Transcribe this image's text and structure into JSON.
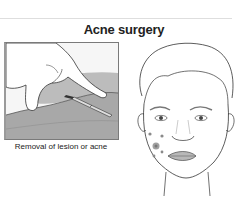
{
  "title": "Acne surgery",
  "left_illustration": {
    "caption": "Removal of lesion or acne",
    "depicts": "hand-with-scalpel-on-skin"
  },
  "right_illustration": {
    "depicts": "face-with-acne-spots-on-left-cheek"
  },
  "colors": {
    "skin_shade": "#9c9c9c",
    "line": "#333333",
    "spot": "#8a8a8a"
  }
}
